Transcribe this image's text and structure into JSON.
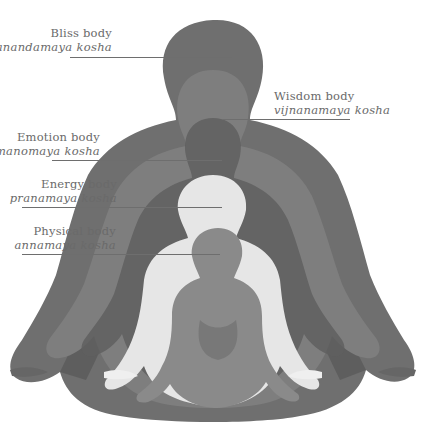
{
  "diagram": {
    "colors": {
      "background": "#ffffff",
      "text": "#6a6a6a",
      "leader_line": "#6e6e6e",
      "layer_bliss": "#6f6f6f",
      "layer_wisdom": "#7e7e7e",
      "layer_emotion": "#5c5c5c",
      "layer_energy": "#e6e6e6",
      "layer_physical": "#8a8a8a"
    },
    "labels": [
      {
        "id": "bliss",
        "title": "Bliss body",
        "sanskrit": "anandamaya kosha"
      },
      {
        "id": "wisdom",
        "title": "Wisdom body",
        "sanskrit": "vijnanamaya kosha"
      },
      {
        "id": "emotion",
        "title": "Emotion body",
        "sanskrit": "manomaya kosha"
      },
      {
        "id": "energy",
        "title": "Energy body",
        "sanskrit": "pranamaya kosha"
      },
      {
        "id": "physical",
        "title": "Physical body",
        "sanskrit": "annamaya kosha"
      }
    ]
  }
}
